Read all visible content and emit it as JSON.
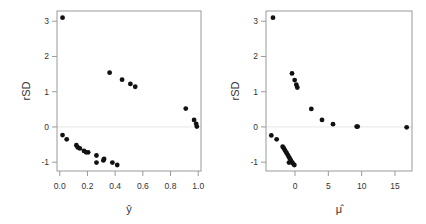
{
  "chart_data": [
    {
      "type": "scatter",
      "title": "",
      "xlabel": "ŷ",
      "ylabel": "rSD",
      "xlim": [
        -0.02,
        1.02
      ],
      "ylim": [
        -1.25,
        3.29
      ],
      "xticks": [
        0.0,
        0.2,
        0.4,
        0.6,
        0.8,
        1.0
      ],
      "xtick_labels": [
        "0.0",
        "0.2",
        "0.4",
        "0.6",
        "0.8",
        "1.0"
      ],
      "yticks": [
        -1,
        0,
        1,
        2,
        3
      ],
      "ytick_labels": [
        "-1",
        "0",
        "1",
        "2",
        "3"
      ],
      "reference_line": {
        "y": 0,
        "color": "#e0e0e0"
      },
      "grid": false,
      "legend": null,
      "points": [
        {
          "x": 0.02,
          "y": 3.1
        },
        {
          "x": 0.02,
          "y": -0.23
        },
        {
          "x": 0.05,
          "y": -0.35
        },
        {
          "x": 0.12,
          "y": -0.52
        },
        {
          "x": 0.13,
          "y": -0.58
        },
        {
          "x": 0.145,
          "y": -0.61
        },
        {
          "x": 0.175,
          "y": -0.68
        },
        {
          "x": 0.19,
          "y": -0.72
        },
        {
          "x": 0.205,
          "y": -0.72
        },
        {
          "x": 0.265,
          "y": -0.81
        },
        {
          "x": 0.265,
          "y": -1.01
        },
        {
          "x": 0.315,
          "y": -0.95
        },
        {
          "x": 0.32,
          "y": -0.91
        },
        {
          "x": 0.38,
          "y": -1.01
        },
        {
          "x": 0.415,
          "y": -1.08
        },
        {
          "x": 0.36,
          "y": 1.54
        },
        {
          "x": 0.45,
          "y": 1.34
        },
        {
          "x": 0.51,
          "y": 1.22
        },
        {
          "x": 0.545,
          "y": 1.14
        },
        {
          "x": 0.91,
          "y": 0.52
        },
        {
          "x": 0.97,
          "y": 0.2
        },
        {
          "x": 0.985,
          "y": 0.09
        },
        {
          "x": 0.99,
          "y": 0.01
        }
      ]
    },
    {
      "type": "scatter",
      "title": "",
      "xlabel": "μ̂",
      "ylabel": "rSD",
      "xlim": [
        -4.35,
        17.55
      ],
      "ylim": [
        -1.25,
        3.29
      ],
      "xticks": [
        0,
        5,
        10,
        15
      ],
      "xtick_labels": [
        "0",
        "5",
        "10",
        "15"
      ],
      "yticks": [
        -1,
        0,
        1,
        2,
        3
      ],
      "ytick_labels": [
        "-1",
        "0",
        "1",
        "2",
        "3"
      ],
      "reference_line": {
        "y": 0,
        "color": "#e0e0e0"
      },
      "grid": false,
      "legend": null,
      "points": [
        {
          "x": -3.3,
          "y": 3.1
        },
        {
          "x": -3.55,
          "y": -0.24
        },
        {
          "x": -2.75,
          "y": -0.35
        },
        {
          "x": -1.85,
          "y": -0.56
        },
        {
          "x": -1.7,
          "y": -0.6
        },
        {
          "x": -1.55,
          "y": -0.65
        },
        {
          "x": -1.4,
          "y": -0.7
        },
        {
          "x": -1.25,
          "y": -0.74
        },
        {
          "x": -1.1,
          "y": -0.79
        },
        {
          "x": -0.95,
          "y": -0.84
        },
        {
          "x": -0.8,
          "y": -0.89
        },
        {
          "x": -0.65,
          "y": -0.94
        },
        {
          "x": -0.9,
          "y": -1.01
        },
        {
          "x": -0.5,
          "y": -0.99
        },
        {
          "x": -0.35,
          "y": -1.03
        },
        {
          "x": -0.1,
          "y": -1.08
        },
        {
          "x": -0.45,
          "y": 1.52
        },
        {
          "x": -0.05,
          "y": 1.33
        },
        {
          "x": 0.2,
          "y": 1.2
        },
        {
          "x": 0.35,
          "y": 1.12
        },
        {
          "x": 2.45,
          "y": 0.51
        },
        {
          "x": 4.05,
          "y": 0.2
        },
        {
          "x": 5.7,
          "y": 0.08
        },
        {
          "x": 9.25,
          "y": 0.01
        },
        {
          "x": 9.4,
          "y": 0.01
        },
        {
          "x": 16.75,
          "y": -0.01
        }
      ]
    }
  ],
  "panels": [
    {
      "xlabel": "ŷ",
      "ylabel": "rSD"
    },
    {
      "xlabel": "μ̂",
      "ylabel": "rSD"
    }
  ],
  "style": {
    "point_color": "#111111",
    "frame_color": "#9a9a9a",
    "text_color": "#333333",
    "zero_line_color": "#e6e6e6"
  }
}
